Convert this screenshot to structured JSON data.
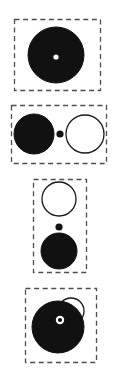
{
  "figure": {
    "type": "diagram",
    "width": 116,
    "height": 372,
    "background": "#ffffff",
    "stroke_color": "#1a1a1a",
    "fill_color": "#111111",
    "open_fill": "#ffffff",
    "panel_border_style": "dashed",
    "panel_border_color": "#4d4d4d",
    "panel_count": 4,
    "panels": [
      {
        "id": "panel-1",
        "index": 1,
        "box": {
          "x": 14,
          "y": 19,
          "w": 86,
          "h": 71
        },
        "layout": "concentric",
        "shapes": [
          {
            "name": "filled-circle-large",
            "kind": "filled-circle",
            "cx": 56,
            "cy": 55,
            "r": 28
          },
          {
            "name": "center-dot-white",
            "kind": "hole-dot",
            "cx": 56,
            "cy": 57,
            "r": 2.6
          }
        ]
      },
      {
        "id": "panel-2",
        "index": 2,
        "box": {
          "x": 11,
          "y": 105,
          "w": 95,
          "h": 58
        },
        "layout": "horizontal",
        "shapes": [
          {
            "name": "filled-circle-left",
            "kind": "filled-circle",
            "cx": 34,
            "cy": 134,
            "r": 20
          },
          {
            "name": "center-dot-black",
            "kind": "filled-dot",
            "cx": 60,
            "cy": 134,
            "r": 3.6
          },
          {
            "name": "open-circle-right",
            "kind": "open-circle",
            "cx": 85,
            "cy": 134,
            "r": 19
          }
        ]
      },
      {
        "id": "panel-3",
        "index": 3,
        "box": {
          "x": 33,
          "y": 179,
          "w": 53,
          "h": 93
        },
        "layout": "vertical",
        "shapes": [
          {
            "name": "open-circle-top",
            "kind": "open-circle",
            "cx": 59,
            "cy": 199,
            "r": 17
          },
          {
            "name": "center-dot-black",
            "kind": "filled-dot",
            "cx": 59,
            "cy": 227,
            "r": 3.6
          },
          {
            "name": "filled-circle-bottom",
            "kind": "filled-circle",
            "cx": 59,
            "cy": 251,
            "r": 18
          }
        ]
      },
      {
        "id": "panel-4",
        "index": 4,
        "box": {
          "x": 25,
          "y": 288,
          "w": 71,
          "h": 74
        },
        "layout": "overlapping",
        "shapes": [
          {
            "name": "open-circle-overlap",
            "kind": "open-circle",
            "cx": 71,
            "cy": 311,
            "r": 13
          },
          {
            "name": "filled-circle-large",
            "kind": "filled-circle",
            "cx": 58,
            "cy": 327,
            "r": 26
          },
          {
            "name": "ring-dot-white",
            "kind": "ring-dot",
            "cx": 60,
            "cy": 320,
            "r_outer": 4.2,
            "r_inner": 2.1
          }
        ]
      }
    ]
  }
}
